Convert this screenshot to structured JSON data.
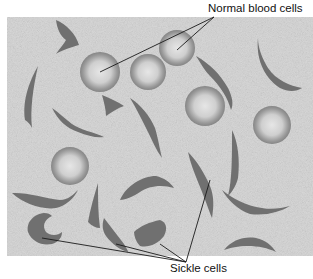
{
  "labels": {
    "normal": "Normal blood cells",
    "sickle": "Sickle cells"
  },
  "colors": {
    "background": "#ffffff",
    "field": "#d9d9d9",
    "normal_cell_rim": "#8e8e8e",
    "normal_cell_center": "#e2e2e2",
    "sickle_cell": "#6f6f6f",
    "leader_line": "#1a1a1a",
    "text": "#111111"
  },
  "field": {
    "x": 7,
    "y": 17,
    "width": 306,
    "height": 239
  },
  "normal_cells": [
    {
      "cx": 100,
      "cy": 72,
      "r": 20
    },
    {
      "cx": 148,
      "cy": 72,
      "r": 18
    },
    {
      "cx": 177,
      "cy": 48,
      "r": 18
    },
    {
      "cx": 205,
      "cy": 106,
      "r": 20
    },
    {
      "cx": 272,
      "cy": 125,
      "r": 19
    },
    {
      "cx": 70,
      "cy": 166,
      "r": 19
    }
  ]
}
